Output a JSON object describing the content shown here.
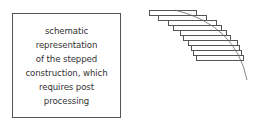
{
  "caption": {
    "lines": [
      "schematic",
      "representation",
      "of the stepped",
      "construction, which",
      "requires post",
      "processing"
    ]
  },
  "diagram": {
    "stroke_color": "#555555",
    "steps": [
      {
        "x": 149,
        "y": 10,
        "w": 47
      },
      {
        "x": 158,
        "y": 15,
        "w": 48
      },
      {
        "x": 168,
        "y": 20,
        "w": 48
      },
      {
        "x": 173,
        "y": 25,
        "w": 48
      },
      {
        "x": 180,
        "y": 30,
        "w": 46
      },
      {
        "x": 183,
        "y": 35,
        "w": 47
      },
      {
        "x": 188,
        "y": 40,
        "w": 49
      },
      {
        "x": 191,
        "y": 45,
        "w": 48
      },
      {
        "x": 193,
        "y": 50,
        "w": 48
      },
      {
        "x": 196,
        "y": 55,
        "w": 47
      }
    ],
    "step_height": 5,
    "curve": "M 175 10 Q 236 25 247 80"
  }
}
